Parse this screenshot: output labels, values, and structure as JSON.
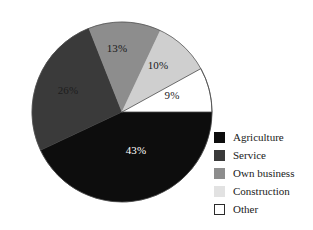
{
  "chart_data": {
    "type": "pie",
    "title": "",
    "subtitle": "",
    "xlabel": "",
    "ylabel": "",
    "grid": false,
    "legend_position": "right",
    "units": "percent",
    "total": 101,
    "categories": [
      "Agriculture",
      "Service",
      "Own business",
      "Construction",
      "Other"
    ],
    "values": [
      43,
      26,
      13,
      10,
      9
    ],
    "labels": [
      "43%",
      "26%",
      "13%",
      "10%",
      "9%"
    ],
    "colors": [
      "#0d0d0d",
      "#3a3a3a",
      "#8d8d8d",
      "#cfcfcf",
      "#ffffff"
    ],
    "slices": [
      {
        "name": "Agriculture",
        "value": 43,
        "label": "43%",
        "color": "#0d0d0d",
        "label_color": "#ffffff",
        "start_angle": 90,
        "end_angle": 244.8,
        "label_x": 136,
        "label_y": 154
      },
      {
        "name": "Service",
        "value": 26,
        "label": "26%",
        "color": "#3a3a3a",
        "label_color": "#1d1d1d",
        "start_angle": 244.8,
        "end_angle": 338.4,
        "label_x": 68,
        "label_y": 94
      },
      {
        "name": "Own business",
        "value": 13,
        "label": "13%",
        "color": "#8d8d8d",
        "label_color": "#1a1a1a",
        "start_angle": 338.4,
        "end_angle": 25.2,
        "label_x": 117,
        "label_y": 52
      },
      {
        "name": "Construction",
        "value": 10,
        "label": "10%",
        "color": "#cfcfcf",
        "label_color": "#1a1a1a",
        "start_angle": 25.2,
        "end_angle": 61.2,
        "label_x": 158,
        "label_y": 69
      },
      {
        "name": "Other",
        "value": 9,
        "label": "9%",
        "color": "#ffffff",
        "label_color": "#1a1a1a",
        "start_angle": 61.2,
        "end_angle": 90,
        "label_x": 172,
        "label_y": 99
      }
    ],
    "geometry": {
      "center_x": 122,
      "center_y": 112,
      "radius": 90
    }
  },
  "legend": {
    "items": [
      {
        "label": "Agriculture",
        "color": "#0d0d0d",
        "bordered": false
      },
      {
        "label": "Service",
        "color": "#3a3a3a",
        "bordered": false
      },
      {
        "label": "Own business",
        "color": "#8d8d8d",
        "bordered": false
      },
      {
        "label": "Construction",
        "color": "#e2e2e2",
        "bordered": false
      },
      {
        "label": "Other",
        "color": "#ffffff",
        "bordered": true
      }
    ]
  }
}
